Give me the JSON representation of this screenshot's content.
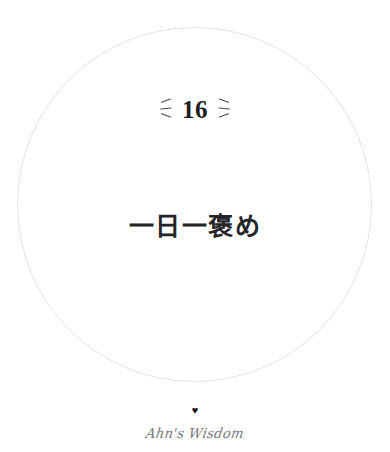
{
  "card": {
    "background_color": "#ffffff",
    "circle": {
      "name": "decorative-circle",
      "stroke_color": "#e3e3e5"
    },
    "number": {
      "value": "16",
      "color": "#1d1d20",
      "left_sparkle_icon": "sparkle-lines-left-icon",
      "right_sparkle_icon": "sparkle-lines-right-icon",
      "sparkle_color": "#4a4a4e"
    },
    "phrase": {
      "text": "一日一褒め",
      "color": "#25252a"
    },
    "footer": {
      "heart_icon": "♥",
      "heart_color": "#16161a",
      "signature": "Ahn's Wisdom",
      "signature_color": "#6d6d72"
    }
  }
}
